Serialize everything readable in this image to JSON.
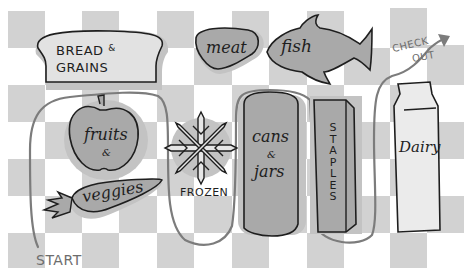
{
  "colors": {
    "background": "#ffffff",
    "checker": "#cfcfcf",
    "shape_fill": "#a9a9a9",
    "shape_light": "#e6e6e6",
    "shadow": "#bdbdbd",
    "outline": "#1e1e1e",
    "path": "#7a7a7a"
  },
  "sections": {
    "bread": {
      "line1": "BREAD",
      "amp": "&",
      "line2": "GRAINS"
    },
    "meat": {
      "label": "meat"
    },
    "fish": {
      "label": "fish"
    },
    "fruits": {
      "label": "fruits",
      "amp": "&"
    },
    "veggies": {
      "label": "veggies"
    },
    "frozen": {
      "label": "FROZEN"
    },
    "cans": {
      "line1": "cans",
      "amp": "&",
      "line2": "jars"
    },
    "staples": {
      "letters": [
        "S",
        "T",
        "A",
        "P",
        "L",
        "E",
        "S"
      ]
    },
    "dairy": {
      "label": "Dairy"
    }
  },
  "route": {
    "start_label": "START",
    "checkout_line1": "CHECK",
    "checkout_line2": "OUT"
  }
}
